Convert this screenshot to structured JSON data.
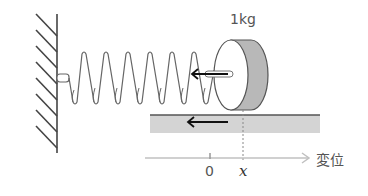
{
  "diagram": {
    "mass_label": "1kg",
    "axis": {
      "origin_label": "0",
      "position_label": "x",
      "axis_title": "変位"
    },
    "colors": {
      "line": "#333333",
      "floor_fill": "#d4d4d4",
      "disk_side": "#b8b8b8",
      "axis": "#c0c0c0",
      "arrow": "#111111"
    },
    "elements": [
      "wall",
      "spring",
      "disk-mass",
      "floor",
      "spring-force-arrow",
      "friction-arrow",
      "displacement-axis"
    ]
  }
}
